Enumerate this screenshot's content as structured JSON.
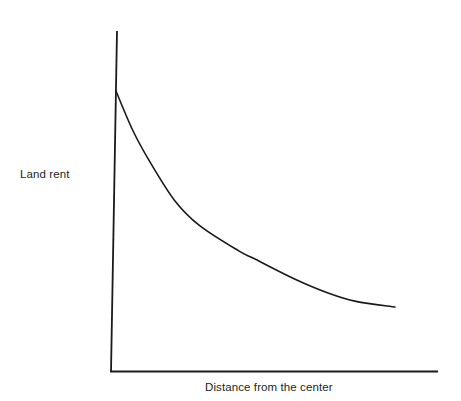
{
  "chart_data": {
    "type": "line",
    "title": "",
    "subtitle": "",
    "xlabel": "Distance from the center",
    "ylabel": "Land rent",
    "grid": false,
    "legend": null,
    "legend_position": "none",
    "axis_ticks": false,
    "tick_labels": {
      "x": [],
      "y": []
    },
    "xlim": [
      0,
      1
    ],
    "ylim": [
      0,
      1
    ],
    "annotations": [],
    "series": [
      {
        "name": "Bid-rent curve",
        "description": "Land rent declines at a decreasing rate with distance from the center (convex exponential decay).",
        "color": "#1a1a1a",
        "line_width": 1.6,
        "x": [
          0.0,
          0.06,
          0.12,
          0.21,
          0.3,
          0.44,
          0.5,
          0.64,
          0.76,
          0.86,
          1.0
        ],
        "y": [
          1.0,
          0.86,
          0.75,
          0.61,
          0.52,
          0.43,
          0.4,
          0.33,
          0.28,
          0.25,
          0.23
        ]
      }
    ]
  },
  "labels": {
    "y_axis": "Land rent",
    "x_axis": "Distance from the center"
  },
  "colors": {
    "background": "#ffffff",
    "axis": "#1a1a1a",
    "curve": "#1a1a1a",
    "text": "#231f20"
  }
}
